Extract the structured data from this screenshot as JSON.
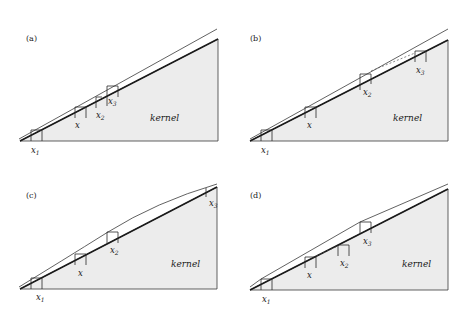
{
  "figure": {
    "panels": [
      {
        "label": "(a)",
        "kernel_label": "kernel",
        "points": {
          "x1": "x",
          "x1_sub": "1",
          "x": "x",
          "x2": "x",
          "x2_sub": "2",
          "x3": "x",
          "x3_sub": "3"
        }
      },
      {
        "label": "(b)",
        "kernel_label": "kernel",
        "points": {
          "x1": "x",
          "x1_sub": "1",
          "x": "x",
          "x2": "x",
          "x2_sub": "2",
          "x3": "x",
          "x3_sub": "3"
        }
      },
      {
        "label": "(c)",
        "kernel_label": "kernel",
        "points": {
          "x1": "x",
          "x1_sub": "1",
          "x": "x",
          "x2": "x",
          "x2_sub": "2",
          "x3": "x",
          "x3_sub": "3"
        }
      },
      {
        "label": "(d)",
        "kernel_label": "kernel",
        "points": {
          "x1": "x",
          "x1_sub": "1",
          "x": "x",
          "x2": "x",
          "x2_sub": "2",
          "x3": "x",
          "x3_sub": "3"
        }
      }
    ]
  }
}
